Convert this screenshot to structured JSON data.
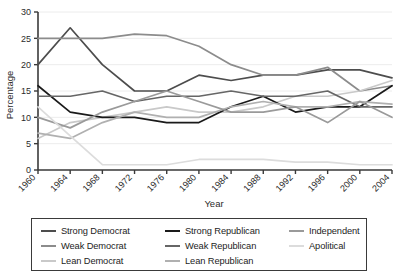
{
  "chart_data": {
    "type": "line",
    "title": "",
    "xlabel": "Year",
    "ylabel": "Percentage",
    "x": [
      1960,
      1964,
      1968,
      1972,
      1976,
      1980,
      1984,
      1988,
      1992,
      1996,
      2000,
      2004
    ],
    "xtick_labels": [
      "1960",
      "1964",
      "1968",
      "1972",
      "1976",
      "1980",
      "1984",
      "1988",
      "1992",
      "1996",
      "2000",
      "2004"
    ],
    "ytick_labels": [
      "0",
      "5",
      "10",
      "15",
      "20",
      "25",
      "30"
    ],
    "ylim": [
      0,
      30
    ],
    "xlim": [
      1960,
      2004
    ],
    "grid": true,
    "legend_position": "below",
    "series": [
      {
        "name": "Strong Democrat",
        "color": "#4d4d4d",
        "values": [
          20.0,
          27.0,
          20.0,
          15.0,
          15.0,
          18.0,
          17.0,
          18.0,
          18.0,
          19.0,
          19.0,
          17.5
        ]
      },
      {
        "name": "Weak Democrat",
        "color": "#8c8c8c",
        "values": [
          25.0,
          25.0,
          25.0,
          25.8,
          25.5,
          23.5,
          20.0,
          18.0,
          18.0,
          19.5,
          15.0,
          16.0
        ]
      },
      {
        "name": "Lean Democrat",
        "color": "#c9c9c9",
        "values": [
          6.0,
          9.0,
          10.0,
          11.0,
          12.0,
          11.0,
          11.0,
          12.0,
          14.0,
          14.0,
          15.0,
          17.0
        ]
      },
      {
        "name": "Strong Republican",
        "color": "#1a1a1a",
        "values": [
          16.0,
          11.0,
          10.0,
          10.0,
          9.0,
          9.0,
          12.0,
          14.0,
          11.0,
          12.0,
          12.0,
          16.0
        ]
      },
      {
        "name": "Weak Republican",
        "color": "#666666",
        "values": [
          14.0,
          14.0,
          15.0,
          13.0,
          14.0,
          14.0,
          15.0,
          14.0,
          14.0,
          15.0,
          12.0,
          12.0
        ]
      },
      {
        "name": "Lean Republican",
        "color": "#b0b0b0",
        "values": [
          7.0,
          6.0,
          9.0,
          11.0,
          10.0,
          10.0,
          12.0,
          13.0,
          12.0,
          12.0,
          13.0,
          12.5
        ]
      },
      {
        "name": "Independent",
        "color": "#9a9a9a",
        "values": [
          10.0,
          8.0,
          11.0,
          13.0,
          15.0,
          13.0,
          11.0,
          11.0,
          12.0,
          9.0,
          13.0,
          10.0
        ]
      },
      {
        "name": "Apolitical",
        "color": "#dcdcdc",
        "values": [
          12.0,
          6.5,
          1.0,
          1.0,
          1.0,
          2.0,
          2.0,
          2.0,
          1.5,
          1.5,
          1.0,
          1.0
        ]
      }
    ]
  },
  "legend": {
    "items": [
      {
        "label": "Strong Democrat",
        "color": "#4d4d4d"
      },
      {
        "label": "Strong Republican",
        "color": "#1a1a1a"
      },
      {
        "label": "Independent",
        "color": "#9a9a9a"
      },
      {
        "label": "Weak Democrat",
        "color": "#8c8c8c"
      },
      {
        "label": "Weak Republican",
        "color": "#666666"
      },
      {
        "label": "Apolitical",
        "color": "#dcdcdc"
      },
      {
        "label": "Lean Democrat",
        "color": "#c9c9c9"
      },
      {
        "label": "Lean Republican",
        "color": "#b0b0b0"
      }
    ]
  }
}
